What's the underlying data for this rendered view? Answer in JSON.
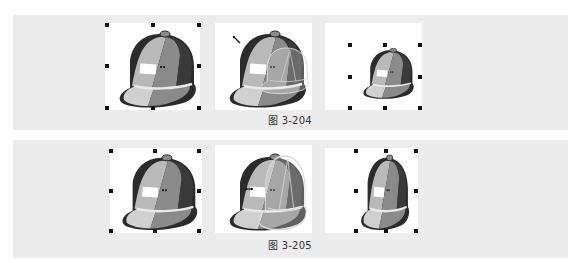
{
  "figures": [
    {
      "caption": "图 3-204",
      "panels": [
        {
          "state": "selected-original",
          "icon": "baseball-cap-icon"
        },
        {
          "state": "scaling-in-progress",
          "icon": "baseball-cap-icon"
        },
        {
          "state": "scaled-down-result",
          "icon": "baseball-cap-icon"
        }
      ]
    },
    {
      "caption": "图 3-205",
      "panels": [
        {
          "state": "selected-original",
          "icon": "baseball-cap-icon"
        },
        {
          "state": "horizontal-scaling-in-progress",
          "icon": "baseball-cap-icon"
        },
        {
          "state": "narrowed-result",
          "icon": "baseball-cap-icon"
        }
      ]
    }
  ],
  "colors": {
    "band": "#ececec",
    "panel": "#ffffff",
    "outline": "#2b2b2b",
    "cap_light": "#b9b9b9",
    "cap_mid": "#8a8a8a",
    "cap_dark": "#3a3a3a",
    "brim_light": "#d0d0d0",
    "handle": "#111111"
  }
}
